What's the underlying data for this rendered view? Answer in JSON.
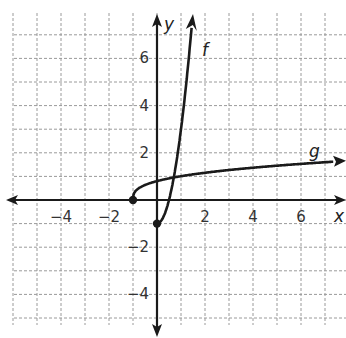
{
  "chart_data": {
    "type": "line",
    "title": "",
    "xlabel": "x",
    "ylabel": "y",
    "xlim": [
      -6,
      7.5
    ],
    "ylim": [
      -5.5,
      8
    ],
    "grid": true,
    "grid_step": 1,
    "x_ticks": [
      -4,
      -2,
      2,
      4,
      6
    ],
    "x_tick_labels": [
      "−4",
      "−2",
      "2",
      "4",
      "6"
    ],
    "y_ticks": [
      6,
      4,
      2,
      -2,
      -4
    ],
    "y_tick_labels": [
      "6",
      "4",
      "2",
      "−2",
      "−4"
    ],
    "series": [
      {
        "name": "f",
        "label": "f",
        "start_point": {
          "x": 0,
          "y": -1,
          "closed": true
        },
        "x": [
          0,
          0.25,
          0.5,
          0.75,
          1.0,
          1.25,
          1.5
        ],
        "y": [
          -1,
          -0.75,
          0,
          1.25,
          3,
          5.25,
          8
        ],
        "end_arrow": true
      },
      {
        "name": "g",
        "label": "g",
        "start_point": {
          "x": -1,
          "y": 0,
          "closed": true
        },
        "x": [
          -1,
          -0.5,
          0,
          1,
          2,
          3,
          4,
          5,
          6,
          7.5
        ],
        "y": [
          0,
          0.63,
          0.8,
          1.01,
          1.15,
          1.27,
          1.37,
          1.45,
          1.53,
          1.64
        ],
        "end_arrow": true
      }
    ]
  },
  "labels": {
    "x_axis": "x",
    "y_axis": "y",
    "f": "f",
    "g": "g",
    "top_cut_text": "g"
  }
}
